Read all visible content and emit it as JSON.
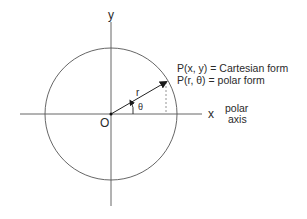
{
  "diagram": {
    "axes": {
      "x_label": "x",
      "y_label": "y",
      "origin_label": "O",
      "polar_axis_line1": "polar",
      "polar_axis_line2": "axis"
    },
    "point": {
      "cartesian_label": "P(x, y) = Cartesian form",
      "polar_label": "P(r, θ) = polar form"
    },
    "radius_label": "r",
    "angle_label": "θ",
    "colors": {
      "line": "#3a3a3a",
      "text": "#2a2a2a",
      "dashed": "#888888",
      "background": "#ffffff"
    }
  }
}
